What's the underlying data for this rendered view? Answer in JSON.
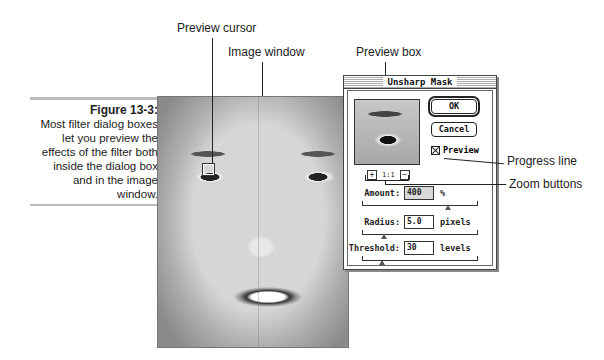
{
  "caption": {
    "title": "Figure 13-3:",
    "lines": [
      "Most filter dialog boxes",
      "let you preview the",
      "effects of the filter both",
      "inside the dialog box",
      "and in the image",
      "window."
    ]
  },
  "callouts": {
    "preview_cursor": "Preview cursor",
    "image_window": "Image window",
    "preview_box": "Preview box",
    "progress_line": "Progress line",
    "zoom_buttons": "Zoom buttons"
  },
  "dialog": {
    "title": "Unsharp Mask",
    "ok_label": "OK",
    "cancel_label": "Cancel",
    "preview_label": "Preview",
    "preview_checked": true,
    "zoom_level": "1:1",
    "zoom_in_glyph": "+",
    "zoom_out_glyph": "−",
    "fields": [
      {
        "label": "Amount:",
        "value": "400",
        "unit": "%",
        "slider_pos": 0.75
      },
      {
        "label": "Radius:",
        "value": "5.0",
        "unit": "pixels",
        "slider_pos": 0.2
      },
      {
        "label": "Threshold:",
        "value": "30",
        "unit": "levels",
        "slider_pos": 0.17
      }
    ]
  }
}
